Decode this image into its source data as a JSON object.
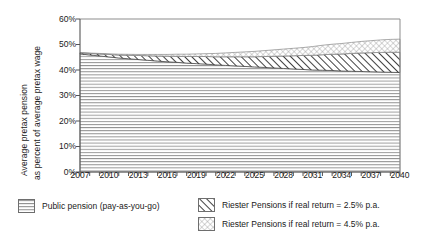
{
  "axes": {
    "ylabel_line1": "Average pretax pension",
    "ylabel_line2": "as percent of average pretax wage",
    "yticks": [
      "60%",
      "50%",
      "40%",
      "30%",
      "20%",
      "10%",
      "0%"
    ],
    "xticks": [
      "2007",
      "2010",
      "2013",
      "2016",
      "2019",
      "2022",
      "2025",
      "2028",
      "2031",
      "2034",
      "2037",
      "2040"
    ]
  },
  "legend": {
    "items": [
      {
        "label": "Public pension (pay-as-you-go)",
        "pattern": "horizontal-lines"
      },
      {
        "label": "Riester Pensions if real return = 2.5% p.a.",
        "pattern": "diagonal-hatch"
      },
      {
        "label": "Riester Pensions if real return = 4.5% p.a.",
        "pattern": "crosshatch-dots"
      }
    ]
  },
  "colors": {
    "axis": "#555555",
    "text": "#1a1a1a",
    "pattern_stroke": "#777777",
    "hatch_stroke": "#222222"
  },
  "chart_data": {
    "type": "area",
    "title": "",
    "xlabel": "",
    "ylabel": "Average pretax pension as percent of average pretax wage",
    "ylim": [
      0,
      60
    ],
    "xlim": [
      2007,
      2040
    ],
    "grid": false,
    "legend_position": "bottom",
    "stacked": true,
    "x": [
      2007,
      2008,
      2009,
      2010,
      2011,
      2012,
      2013,
      2014,
      2015,
      2016,
      2017,
      2018,
      2019,
      2020,
      2021,
      2022,
      2023,
      2024,
      2025,
      2026,
      2027,
      2028,
      2029,
      2030,
      2031,
      2032,
      2033,
      2034,
      2035,
      2036,
      2037,
      2038,
      2039,
      2040
    ],
    "series": [
      {
        "name": "Public pension (pay-as-you-go)",
        "pattern": "horizontal-lines",
        "values": [
          46.3,
          45.9,
          45.5,
          45.1,
          44.7,
          44.4,
          44.1,
          43.8,
          43.5,
          43.2,
          43.0,
          42.7,
          42.5,
          42.3,
          42.0,
          41.8,
          41.6,
          41.4,
          41.2,
          41.0,
          40.8,
          40.6,
          40.4,
          40.2,
          40.0,
          39.9,
          39.8,
          39.6,
          39.5,
          39.4,
          39.3,
          39.2,
          39.1,
          39.0
        ]
      },
      {
        "name": "Riester Pensions if real return = 2.5% p.a.",
        "pattern": "diagonal-hatch",
        "values": [
          0.4,
          0.6,
          0.8,
          1.0,
          1.2,
          1.4,
          1.6,
          1.8,
          2.0,
          2.2,
          2.4,
          2.6,
          2.8,
          3.0,
          3.2,
          3.4,
          3.6,
          3.8,
          4.0,
          4.3,
          4.6,
          4.9,
          5.2,
          5.5,
          5.8,
          6.1,
          6.4,
          6.7,
          7.0,
          7.3,
          7.5,
          7.7,
          7.9,
          8.0
        ]
      },
      {
        "name": "Riester Pensions if real return = 4.5% p.a.",
        "pattern": "crosshatch-dots",
        "values": [
          0.1,
          0.15,
          0.2,
          0.25,
          0.3,
          0.35,
          0.4,
          0.5,
          0.6,
          0.7,
          0.8,
          0.9,
          1.0,
          1.1,
          1.3,
          1.5,
          1.7,
          1.9,
          2.1,
          2.3,
          2.5,
          2.7,
          2.9,
          3.1,
          3.4,
          3.7,
          3.9,
          4.1,
          4.3,
          4.5,
          4.7,
          4.9,
          5.0,
          5.1
        ]
      }
    ]
  }
}
